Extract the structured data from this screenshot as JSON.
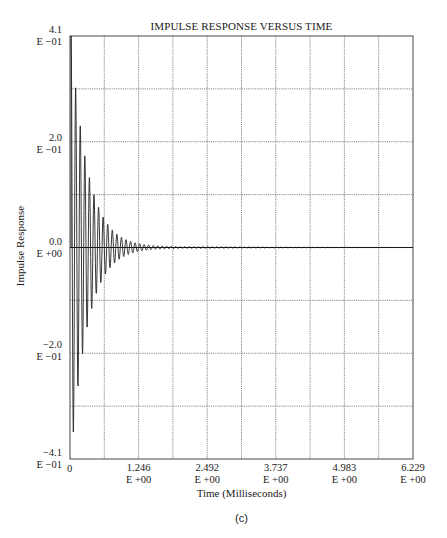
{
  "chart_data": {
    "type": "line",
    "title": "IMPULSE RESPONSE VERSUS TIME",
    "xlabel": "Time (Milliseconds)",
    "ylabel": "Impulse Response",
    "caption": "(c)",
    "xlim": [
      0,
      6.229
    ],
    "ylim": [
      -0.41,
      0.41
    ],
    "grid": true,
    "x_grid_divisions": 10,
    "y_grid_divisions": 8,
    "x_ticks": [
      {
        "value": 0,
        "line1": "0",
        "line2": ""
      },
      {
        "value": 1.246,
        "line1": "1.246",
        "line2": "E +00"
      },
      {
        "value": 2.492,
        "line1": "2.492",
        "line2": "E +00"
      },
      {
        "value": 3.737,
        "line1": "3.737",
        "line2": "E +00"
      },
      {
        "value": 4.983,
        "line1": "4.983",
        "line2": "E +00"
      },
      {
        "value": 6.229,
        "line1": "6.229",
        "line2": "E +00"
      }
    ],
    "y_ticks": [
      {
        "value": 0.41,
        "line1": "4.1",
        "line2": "E −01"
      },
      {
        "value": 0.2,
        "line1": "2.0",
        "line2": "E −01"
      },
      {
        "value": 0.0,
        "line1": "0.0",
        "line2": "E +00"
      },
      {
        "value": -0.2,
        "line1": "−2.0",
        "line2": "E −01"
      },
      {
        "value": -0.41,
        "line1": "−4.1",
        "line2": "E −01"
      }
    ],
    "series": [
      {
        "name": "Impulse Response",
        "model": "damped_sinusoid",
        "amplitude": 0.41,
        "frequency_khz": 12.0,
        "decay_time_constant_ms": 0.3,
        "phase_rad": 1.5708,
        "sample_step_ms": 0.0045,
        "peaks": [
          {
            "x": 0.03,
            "y": 0.41
          },
          {
            "x": 0.08,
            "y": -0.34
          },
          {
            "x": 0.16,
            "y": 0.18
          },
          {
            "x": 0.21,
            "y": -0.29
          },
          {
            "x": 0.3,
            "y": 0.12
          },
          {
            "x": 0.5,
            "y": 0.07
          },
          {
            "x": 1.0,
            "y": 0.02
          },
          {
            "x": 2.0,
            "y": 0.0
          }
        ]
      }
    ]
  }
}
